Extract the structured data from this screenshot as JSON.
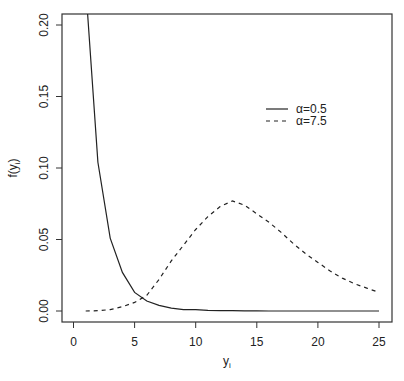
{
  "chart_data": {
    "type": "line",
    "title": "",
    "xlabel": "y",
    "xlabel_subscript": "i",
    "ylabel": "f(y",
    "ylabel_subscript": "i",
    "ylabel_close": ")",
    "xlim": [
      -1,
      26
    ],
    "ylim": [
      -0.008,
      0.208
    ],
    "xticks": [
      0,
      5,
      10,
      15,
      20,
      25
    ],
    "xtick_labels": [
      "0",
      "5",
      "10",
      "15",
      "20",
      "25"
    ],
    "yticks": [
      0.0,
      0.05,
      0.1,
      0.15,
      0.2
    ],
    "ytick_labels": [
      "0.00",
      "0.05",
      "0.10",
      "0.15",
      "0.20"
    ],
    "grid": false,
    "legend_position": "upper right (inside)",
    "x": [
      1,
      2,
      3,
      4,
      5,
      6,
      7,
      8,
      9,
      10,
      11,
      12,
      13,
      14,
      15,
      16,
      17,
      18,
      19,
      20,
      21,
      22,
      23,
      24,
      25
    ],
    "series": [
      {
        "name": "α= 0.5",
        "style": "solid",
        "values": [
          0.227,
          0.104,
          0.051,
          0.027,
          0.013,
          0.007,
          0.004,
          0.002,
          0.001,
          0.001,
          0.0005,
          0.0003,
          0.0002,
          0.0001,
          0.0001,
          0.0,
          0.0,
          0.0,
          0.0,
          0.0,
          0.0,
          0.0,
          0.0,
          0.0,
          0.0
        ]
      },
      {
        "name": "α= 7.5",
        "style": "dashed",
        "values": [
          0.0,
          0.0002,
          0.001,
          0.003,
          0.006,
          0.011,
          0.022,
          0.035,
          0.046,
          0.057,
          0.066,
          0.073,
          0.077,
          0.074,
          0.068,
          0.062,
          0.055,
          0.047,
          0.04,
          0.034,
          0.028,
          0.023,
          0.019,
          0.016,
          0.013
        ]
      }
    ],
    "legend": [
      {
        "symbol": "α=",
        "value": "0.5",
        "style": "solid"
      },
      {
        "symbol": "α=",
        "value": "7.5",
        "style": "dashed"
      }
    ]
  },
  "colors": {
    "line": "#222222",
    "axis": "#333333",
    "background": "#ffffff"
  }
}
